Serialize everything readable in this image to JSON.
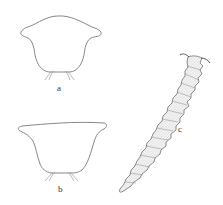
{
  "figure": {
    "panels": [
      {
        "id": "a",
        "label": "a",
        "description": "outline of segment, rounded lateral lobes"
      },
      {
        "id": "b",
        "label": "b",
        "description": "outline of segment, broad flat anterior margin"
      },
      {
        "id": "c",
        "label": "c",
        "description": "segmented elongate larva, stippled"
      }
    ]
  },
  "colors": {
    "background": "#ffffff",
    "line": "#7a7a7a",
    "stipple": "#b5b5b5",
    "label": "#333333"
  }
}
